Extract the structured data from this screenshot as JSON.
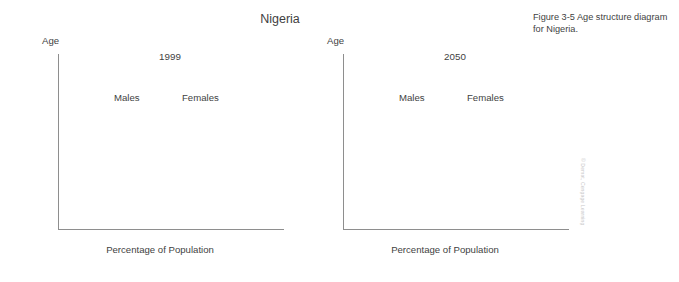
{
  "title": "Nigeria",
  "caption": "Figure 3-5 Age structure diagram for Nigeria.",
  "credit": "© Demat, Cengage Learning",
  "axis_title_age": "Age",
  "axis_title_x": "Percentage of Population",
  "labels": {
    "males": "Males",
    "females": "Females"
  },
  "panels": [
    {
      "year": "1999"
    },
    {
      "year": "2050"
    }
  ],
  "y_tick_labels": [
    "0",
    "10",
    "20",
    "30",
    "40",
    "50",
    "60",
    "70",
    "80",
    "90",
    "100+"
  ],
  "x_tick_labels": [
    "8",
    "6",
    "4",
    "2",
    "0",
    "2",
    "4",
    "6",
    "8"
  ],
  "chart_data": [
    {
      "type": "bar",
      "title": "1999",
      "subtitle": "Nigeria age structure diagram, 1999",
      "orientation": "horizontal-diverging",
      "xlabel": "Percentage of Population",
      "ylabel": "Age",
      "xlim": [
        -9,
        9
      ],
      "x_ticks": [
        -8,
        -6,
        -4,
        -2,
        0,
        2,
        4,
        6,
        8
      ],
      "x_tick_labels": [
        "8",
        "6",
        "4",
        "2",
        "0",
        "2",
        "4",
        "6",
        "8"
      ],
      "ylim": [
        0,
        100
      ],
      "y_ticks": [
        0,
        10,
        20,
        30,
        40,
        50,
        60,
        70,
        80,
        90,
        100
      ],
      "y_tick_labels": [
        "0",
        "10",
        "20",
        "30",
        "40",
        "50",
        "60",
        "70",
        "80",
        "90",
        "100+"
      ],
      "grid": false,
      "legend": [
        "Males",
        "Females"
      ],
      "legend_position": "inside-top",
      "categories": [
        "0-4",
        "5-9",
        "10-14",
        "15-19",
        "20-24",
        "25-29",
        "30-34",
        "35-39",
        "40-44",
        "45-49",
        "50-54",
        "55-59",
        "60-64",
        "65-69",
        "70-74",
        "75-79",
        "80-84",
        "85-89",
        "90-94",
        "95-99",
        "100+"
      ],
      "series": [
        {
          "name": "Males",
          "values": [
            5.7,
            5.0,
            4.4,
            3.9,
            3.4,
            2.9,
            2.5,
            2.1,
            1.8,
            1.5,
            1.25,
            1.0,
            0.8,
            0.6,
            0.42,
            0.27,
            0.15,
            0.07,
            0.03,
            0.01,
            0.0
          ]
        },
        {
          "name": "Females",
          "values": [
            5.7,
            5.0,
            4.4,
            3.9,
            3.4,
            2.9,
            2.5,
            2.1,
            1.8,
            1.5,
            1.25,
            1.0,
            0.8,
            0.6,
            0.42,
            0.27,
            0.15,
            0.07,
            0.03,
            0.01,
            0.0
          ]
        }
      ]
    },
    {
      "type": "bar",
      "title": "2050",
      "subtitle": "Nigeria age structure diagram, 2050 projection",
      "orientation": "horizontal-diverging",
      "xlabel": "Percentage of Population",
      "ylabel": "Age",
      "xlim": [
        -9,
        9
      ],
      "x_ticks": [
        -8,
        -6,
        -4,
        -2,
        0,
        2,
        4,
        6,
        8
      ],
      "x_tick_labels": [
        "8",
        "6",
        "4",
        "2",
        "0",
        "2",
        "4",
        "6",
        "8"
      ],
      "ylim": [
        0,
        100
      ],
      "y_ticks": [
        0,
        10,
        20,
        30,
        40,
        50,
        60,
        70,
        80,
        90,
        100
      ],
      "y_tick_labels": [
        "0",
        "10",
        "20",
        "30",
        "40",
        "50",
        "60",
        "70",
        "80",
        "90",
        "100+"
      ],
      "grid": false,
      "legend": [
        "Males",
        "Females"
      ],
      "legend_position": "inside-top",
      "categories": [
        "0-4",
        "5-9",
        "10-14",
        "15-19",
        "20-24",
        "25-29",
        "30-34",
        "35-39",
        "40-44",
        "45-49",
        "50-54",
        "55-59",
        "60-64",
        "65-69",
        "70-74",
        "75-79",
        "80-84",
        "85-89",
        "90-94",
        "95-99",
        "100+"
      ],
      "series": [
        {
          "name": "Males",
          "values": [
            3.3,
            3.35,
            3.4,
            3.4,
            3.4,
            3.35,
            3.3,
            3.15,
            2.95,
            2.7,
            2.45,
            2.2,
            1.95,
            1.7,
            1.4,
            1.05,
            0.7,
            0.38,
            0.15,
            0.05,
            0.0
          ]
        },
        {
          "name": "Females",
          "values": [
            3.3,
            3.35,
            3.4,
            3.4,
            3.4,
            3.35,
            3.3,
            3.15,
            2.95,
            2.7,
            2.45,
            2.2,
            1.95,
            1.7,
            1.4,
            1.05,
            0.7,
            0.38,
            0.15,
            0.05,
            0.0
          ]
        }
      ]
    }
  ]
}
